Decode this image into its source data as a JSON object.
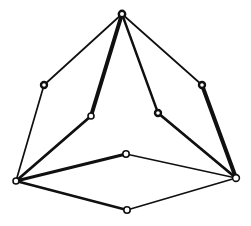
{
  "figure": {
    "background_color": "#ffffff",
    "stroke_color": "#101010",
    "node_fill_color": "#ffffff",
    "width": 251,
    "height": 226,
    "nodes": [
      {
        "id": "apex",
        "label": "apex-joint",
        "x": 122,
        "y": 14,
        "r": 3.2,
        "style": "solid"
      },
      {
        "id": "left-upper",
        "label": "left-upper-joint",
        "x": 44,
        "y": 85,
        "r": 3.0,
        "style": "solid"
      },
      {
        "id": "right-upper",
        "label": "right-upper-joint",
        "x": 202,
        "y": 85,
        "r": 3.0,
        "style": "solid"
      },
      {
        "id": "inner-left",
        "label": "inner-left-joint",
        "x": 91,
        "y": 116,
        "r": 3.0,
        "style": "ring"
      },
      {
        "id": "inner-right",
        "label": "inner-right-joint",
        "x": 158,
        "y": 113,
        "r": 3.0,
        "style": "solid"
      },
      {
        "id": "base-left",
        "label": "base-left-vertex",
        "x": 16,
        "y": 181,
        "r": 3.0,
        "style": "ring"
      },
      {
        "id": "base-right",
        "label": "base-right-vertex",
        "x": 236,
        "y": 178,
        "r": 3.4,
        "style": "ring"
      },
      {
        "id": "base-top",
        "label": "base-rear-vertex",
        "x": 126,
        "y": 154,
        "r": 3.2,
        "style": "ring"
      },
      {
        "id": "base-bottom",
        "label": "base-front-vertex",
        "x": 127,
        "y": 210,
        "r": 3.2,
        "style": "ring"
      }
    ],
    "edges": [
      {
        "id": "e1",
        "label": "apex-to-left-upper",
        "from": "apex",
        "to": "left-upper",
        "width": 1.7
      },
      {
        "id": "e2",
        "label": "apex-to-right-upper",
        "from": "apex",
        "to": "right-upper",
        "width": 1.7
      },
      {
        "id": "e3",
        "label": "apex-to-inner-left",
        "from": "apex",
        "to": "inner-left",
        "width": 4.0
      },
      {
        "id": "e4",
        "label": "apex-to-inner-right",
        "from": "apex",
        "to": "inner-right",
        "width": 2.4
      },
      {
        "id": "e5",
        "label": "left-upper-to-base-left",
        "from": "left-upper",
        "to": "base-left",
        "width": 1.7
      },
      {
        "id": "e6",
        "label": "inner-left-to-base-left",
        "from": "inner-left",
        "to": "base-left",
        "width": 2.8
      },
      {
        "id": "e7",
        "label": "right-upper-to-base-right",
        "from": "right-upper",
        "to": "base-right",
        "width": 4.0
      },
      {
        "id": "e8",
        "label": "inner-right-to-base-right",
        "from": "inner-right",
        "to": "base-right",
        "width": 2.8
      },
      {
        "id": "e9",
        "label": "base-left-to-base-top",
        "from": "base-left",
        "to": "base-top",
        "width": 3.2
      },
      {
        "id": "e10",
        "label": "base-top-to-base-right",
        "from": "base-top",
        "to": "base-right",
        "width": 1.5
      },
      {
        "id": "e11",
        "label": "base-left-to-base-bottom",
        "from": "base-left",
        "to": "base-bottom",
        "width": 2.6
      },
      {
        "id": "e12",
        "label": "base-bottom-to-base-right",
        "from": "base-bottom",
        "to": "base-right",
        "width": 1.8
      }
    ]
  }
}
